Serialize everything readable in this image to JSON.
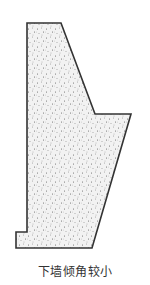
{
  "diagram": {
    "type": "retaining-wall-cross-section",
    "caption": "下墙倾角较小",
    "fill_pattern": "stippled-concrete",
    "colors": {
      "outline": "#333333",
      "fill": "#f2f2f2",
      "dots": "#555555",
      "caption": "#333333"
    },
    "outline_points": [
      [
        27,
        23
      ],
      [
        61,
        23
      ],
      [
        95,
        114
      ],
      [
        131,
        114
      ],
      [
        92,
        248
      ],
      [
        16,
        248
      ],
      [
        16,
        232
      ],
      [
        27,
        232
      ]
    ]
  }
}
